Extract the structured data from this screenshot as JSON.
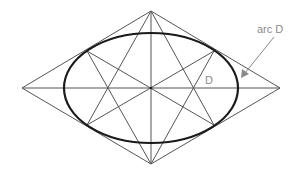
{
  "diagram": {
    "labels": {
      "arc": "arc D",
      "point": "D"
    },
    "colors": {
      "background": "#ffffff",
      "construction_line": "#555555",
      "ellipse": "#1a1a1a",
      "annotation": "#8a8a8a"
    },
    "rhombus": {
      "top": [
        151,
        11
      ],
      "right": [
        280,
        88
      ],
      "bottom": [
        151,
        164
      ],
      "left": [
        22,
        88
      ]
    },
    "ellipse": {
      "center": [
        151,
        88
      ],
      "rx": 87,
      "ry": 55
    },
    "tangent_points": {
      "upper_left": [
        87,
        51
      ],
      "upper_right": [
        214,
        51
      ],
      "lower_right": [
        214,
        125
      ],
      "lower_left": [
        87,
        125
      ]
    }
  }
}
